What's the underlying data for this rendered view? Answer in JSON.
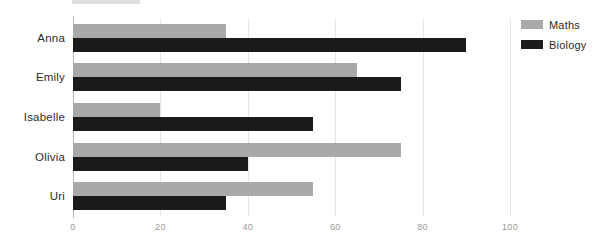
{
  "chart_data": {
    "type": "bar",
    "orientation": "horizontal",
    "title": "",
    "subtitle": "",
    "xlabel": "",
    "ylabel": "",
    "categories": [
      "Anna",
      "Emily",
      "Isabelle",
      "Olivia",
      "Uri"
    ],
    "series": [
      {
        "name": "Maths",
        "color": "#a9a9a9",
        "values": [
          35,
          65,
          20,
          75,
          55
        ]
      },
      {
        "name": "Biology",
        "color": "#1b1b1b",
        "values": [
          90,
          75,
          55,
          40,
          35
        ]
      }
    ],
    "xlim": [
      0,
      100
    ],
    "xticks": [
      0,
      20,
      40,
      60,
      80,
      100
    ],
    "xtick_labels": [
      "0",
      "20",
      "40",
      "60",
      "80",
      "100"
    ],
    "grid": true,
    "grid_axis": "x",
    "legend": {
      "position": "top-right",
      "entries": [
        {
          "label": "Maths",
          "color": "#a9a9a9"
        },
        {
          "label": "Biology",
          "color": "#1b1b1b"
        }
      ]
    }
  },
  "colors": {
    "maths": "#a9a9a9",
    "biology": "#1b1b1b",
    "gridline": "#e6e6e6",
    "axis": "#b9b9b9",
    "tick_text": "#9a9a9a",
    "label_text": "#2b2b2b",
    "background": "#ffffff"
  }
}
